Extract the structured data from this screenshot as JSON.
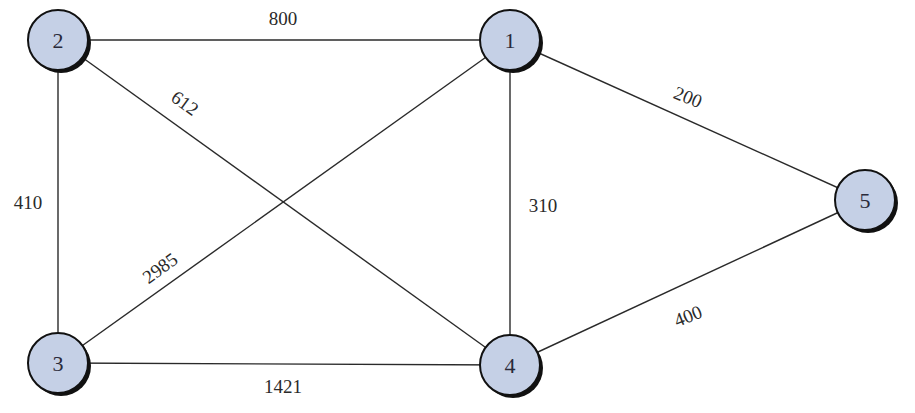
{
  "diagram": {
    "type": "weighted-undirected-graph",
    "nodes": [
      {
        "id": "1",
        "label": "1",
        "x": 510,
        "y": 40
      },
      {
        "id": "2",
        "label": "2",
        "x": 58,
        "y": 40
      },
      {
        "id": "3",
        "label": "3",
        "x": 58,
        "y": 363
      },
      {
        "id": "4",
        "label": "4",
        "x": 510,
        "y": 365
      },
      {
        "id": "5",
        "label": "5",
        "x": 865,
        "y": 200
      }
    ],
    "edges": [
      {
        "from": "2",
        "to": "1",
        "weight": "800",
        "lx": 283,
        "ly": 18,
        "rot": 0
      },
      {
        "from": "2",
        "to": "3",
        "weight": "410",
        "lx": 28,
        "ly": 202,
        "rot": 0
      },
      {
        "from": "2",
        "to": "4",
        "weight": "612",
        "lx": 185,
        "ly": 103,
        "rot": 36
      },
      {
        "from": "3",
        "to": "1",
        "weight": "2985",
        "lx": 160,
        "ly": 268,
        "rot": -36
      },
      {
        "from": "1",
        "to": "4",
        "weight": "310",
        "lx": 543,
        "ly": 205,
        "rot": 0
      },
      {
        "from": "3",
        "to": "4",
        "weight": "1421",
        "lx": 283,
        "ly": 386,
        "rot": 0
      },
      {
        "from": "1",
        "to": "5",
        "weight": "200",
        "lx": 688,
        "ly": 97,
        "rot": 22
      },
      {
        "from": "4",
        "to": "5",
        "weight": "400",
        "lx": 688,
        "ly": 316,
        "rot": -22
      }
    ],
    "colors": {
      "node_fill": "#c5d0e6",
      "node_stroke": "#111111",
      "edge": "#2a2a2a",
      "background": "#ffffff"
    }
  }
}
